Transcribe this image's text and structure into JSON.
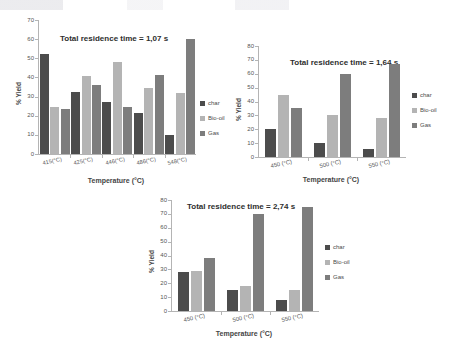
{
  "figure": {
    "background": "#ffffff",
    "series_colors": {
      "char": "#4c4c4c",
      "bio_oil": "#b4b4b4",
      "gas": "#7d7d7d"
    }
  },
  "legend_labels": {
    "char": "char",
    "bio_oil": "Bio-oil",
    "gas": "Gas"
  },
  "chart_data": [
    {
      "type": "bar",
      "id": "chart-1",
      "title": "Total residence time = 1,07 s",
      "xlabel": "Temperature (°C)",
      "ylabel": "% Yield",
      "ylim": [
        0,
        70
      ],
      "ytick_step": 10,
      "yticks": [
        0,
        10,
        20,
        30,
        40,
        50,
        60,
        70
      ],
      "grid": false,
      "legend_position": "right",
      "categories": [
        "415(°C)",
        "425(°C)",
        "446(°C)",
        "486(°C)",
        "548(°C)"
      ],
      "series": [
        {
          "name": "char",
          "values": [
            52,
            32.5,
            27,
            21.5,
            10
          ]
        },
        {
          "name": "Bio-oil",
          "values": [
            24.5,
            40.5,
            48,
            34.5,
            32
          ]
        },
        {
          "name": "Gas",
          "values": [
            23.5,
            36,
            24.5,
            41.5,
            60
          ]
        }
      ]
    },
    {
      "type": "bar",
      "id": "chart-2",
      "title": "Total residence time = 1,64 s",
      "xlabel": "Temperature (°C)",
      "ylabel": "% Yield",
      "ylim": [
        0,
        80
      ],
      "ytick_step": 10,
      "yticks": [
        0,
        10,
        20,
        30,
        40,
        50,
        60,
        70,
        80
      ],
      "grid": false,
      "legend_position": "right",
      "categories": [
        "450 (°C)",
        "500 (°C)",
        "550 (°C)"
      ],
      "series": [
        {
          "name": "char",
          "values": [
            20,
            10,
            6
          ]
        },
        {
          "name": "Bio-oil",
          "values": [
            45,
            30,
            28
          ]
        },
        {
          "name": "Gas",
          "values": [
            35,
            60,
            67
          ]
        }
      ]
    },
    {
      "type": "bar",
      "id": "chart-3",
      "title": "Total residence time = 2,74 s",
      "xlabel": "Temperature (°C)",
      "ylabel": "% Yield",
      "ylim": [
        0,
        80
      ],
      "ytick_step": 10,
      "yticks": [
        0,
        10,
        20,
        30,
        40,
        50,
        60,
        70,
        80
      ],
      "grid": false,
      "legend_position": "right",
      "categories": [
        "450 (°C)",
        "500 (°C)",
        "550 (°C)"
      ],
      "series": [
        {
          "name": "char",
          "values": [
            28,
            15,
            8
          ]
        },
        {
          "name": "Bio-oil",
          "values": [
            29,
            18,
            15
          ]
        },
        {
          "name": "Gas",
          "values": [
            38,
            70,
            75
          ]
        }
      ]
    }
  ]
}
